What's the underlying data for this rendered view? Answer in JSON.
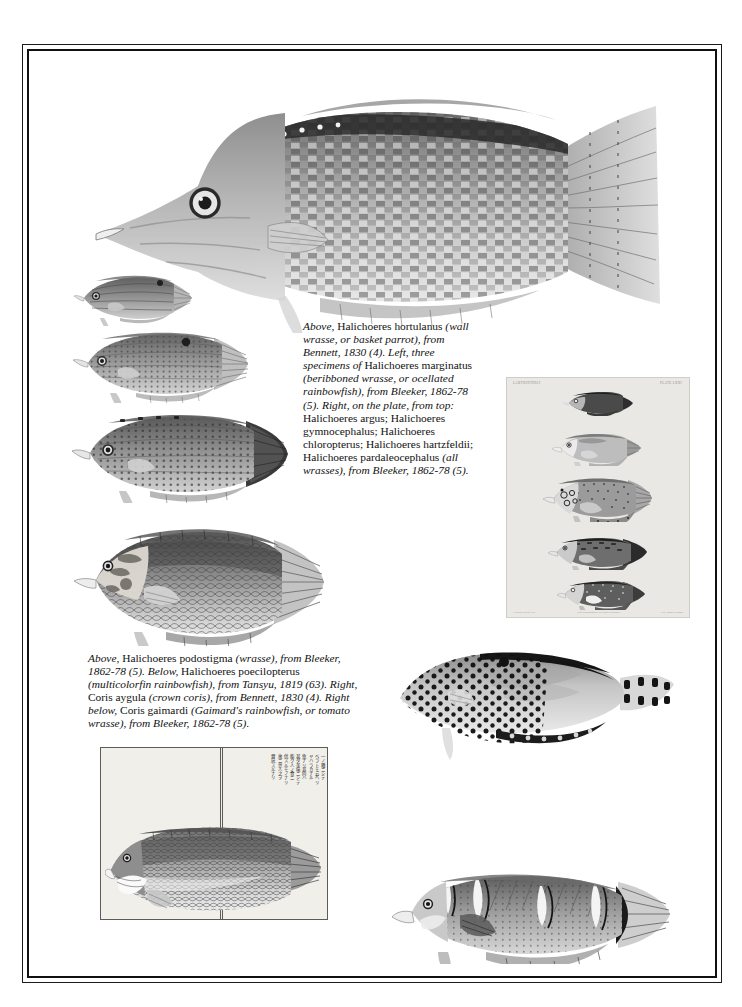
{
  "page": {
    "background_color": "#ffffff",
    "border_color": "#101010"
  },
  "captions": {
    "top": {
      "name": "caption-upper-plate",
      "segments": [
        {
          "text": "Above,",
          "style": "italic"
        },
        {
          "text": " Halichoeres hortulanus ",
          "style": "roman"
        },
        {
          "text": "(wall wrasse, or basket parrot), from Bennett, 1830 (4). Left, three specimens of",
          "style": "italic"
        },
        {
          "text": " Halichoeres marginatus ",
          "style": "roman"
        },
        {
          "text": "(beribboned wrasse, or ocellated rainbowfish), from Bleeker, 1862-78 (5). Right, on the plate, from top:",
          "style": "italic"
        },
        {
          "text": " Halichoeres argus; Halichoeres gymnocephalus; Halichoeres chloropterus; Halichoeres hartzfeldii; Halichoeres pardaleocephalus ",
          "style": "roman"
        },
        {
          "text": "(all wrasses), from Bleeker, 1862-78 (5).",
          "style": "italic"
        }
      ]
    },
    "bottom": {
      "name": "caption-lower-plate",
      "segments": [
        {
          "text": "Above,",
          "style": "italic"
        },
        {
          "text": " Halichoeres podostigma ",
          "style": "roman"
        },
        {
          "text": "(wrasse), from Bleeker, 1862-78 (5). Below,",
          "style": "italic"
        },
        {
          "text": " Halichoeres poecilopterus ",
          "style": "roman"
        },
        {
          "text": "(multicolorfin rainbowfish), from Tansyu, 1819 (63). Right,",
          "style": "italic"
        },
        {
          "text": " Coris aygula ",
          "style": "roman"
        },
        {
          "text": "(crown coris), from Bennett, 1830 (4). Right below,",
          "style": "italic"
        },
        {
          "text": " Coris gaimardi ",
          "style": "roman"
        },
        {
          "text": "(Gaimard's rainbowfish, or tomato wrasse), from Bleeker, 1862-78 (5).",
          "style": "italic"
        }
      ]
    }
  },
  "figures": {
    "main_wrasse": {
      "label": "Halichoeres hortulanus",
      "common_name": "wall wrasse, or basket parrot",
      "source": "Bennett, 1830 (4)"
    },
    "marginatus_specimens": [
      {
        "label": "Halichoeres marginatus specimen 1",
        "size": "small"
      },
      {
        "label": "Halichoeres marginatus specimen 2",
        "size": "medium"
      },
      {
        "label": "Halichoeres marginatus specimen 3",
        "size": "large"
      }
    ],
    "podostigma": {
      "label": "Halichoeres podostigma",
      "source": "Bleeker, 1862-78 (5)"
    },
    "coris_aygula": {
      "label": "Coris aygula",
      "common_name": "crown coris",
      "source": "Bennett, 1830 (4)"
    },
    "coris_gaimardi": {
      "label": "Coris gaimardi",
      "common_name": "Gaimard's rainbowfish, or tomato wrasse",
      "source": "Bleeker, 1862-78 (5)"
    }
  },
  "plate": {
    "name": "bleeker-plate",
    "background_color": "#e9e8e4",
    "header_left": "LABYRINTHICI",
    "header_right": "PLATE LXXI",
    "footer_left": "P. Bleeker ad nat. del.",
    "footer_center": "Atlas Ichthyologique des Indes Orientales",
    "footer_right": "Lith. Emrik & Binger",
    "species": [
      {
        "order": 1,
        "label": "Halichoeres argus"
      },
      {
        "order": 2,
        "label": "Halichoeres gymnocephalus"
      },
      {
        "order": 3,
        "label": "Halichoeres chloropterus"
      },
      {
        "order": 4,
        "label": "Halichoeres hartzfeldii"
      },
      {
        "order": 5,
        "label": "Halichoeres pardaleocephalus"
      }
    ]
  },
  "woodblock": {
    "name": "japanese-woodblock-print",
    "label": "Halichoeres poecilopterus",
    "source": "Tansyu, 1819 (63)",
    "background_color": "#f1efe9",
    "text_columns": [
      "一ノ種ニシテ",
      "ベラトモ云ヘリ",
      "ヤハラカナル",
      "魚ナリ其肉ハ",
      "甚ダ美味ニシテ",
      "能ク人ノ食ニ",
      "供スルモノナリ",
      "故ニ世人之ヲ",
      "賞玩スルナリ"
    ]
  }
}
